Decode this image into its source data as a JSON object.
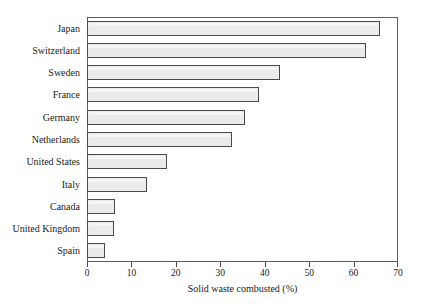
{
  "chart_data": {
    "type": "bar",
    "orientation": "horizontal",
    "title": "",
    "xlabel": "Solid waste combusted (%)",
    "ylabel": "",
    "xlim": [
      0,
      70
    ],
    "xticks": [
      0,
      10,
      20,
      30,
      40,
      50,
      60,
      70
    ],
    "xtick_labels": [
      "0",
      "10",
      "20",
      "30",
      "40",
      "50",
      "60",
      "70"
    ],
    "grid": false,
    "legend": null,
    "categories": [
      "Japan",
      "Switzerland",
      "Sweden",
      "France",
      "Germany",
      "Netherlands",
      "United States",
      "Italy",
      "Canada",
      "United Kingdom",
      "Spain"
    ],
    "values": [
      66,
      62.7,
      43.5,
      38.7,
      35.5,
      32.7,
      18,
      13.5,
      6.3,
      6,
      4
    ],
    "bar_fill": "#ebebeb",
    "bar_border": "#4a4a4a",
    "frame_color": "#5d5d5d",
    "background": "#ffffff"
  }
}
